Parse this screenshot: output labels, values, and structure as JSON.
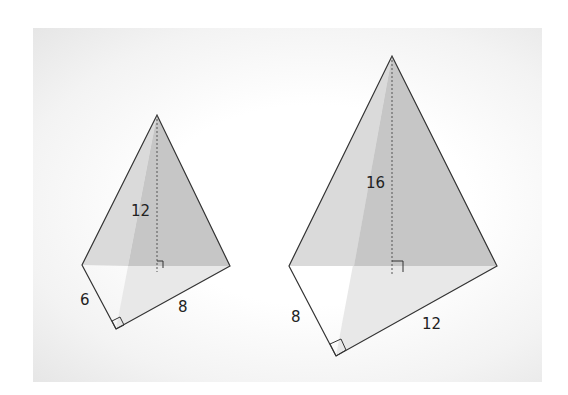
{
  "figures": [
    {
      "id": "small-pyramid",
      "labels": {
        "height": "12",
        "leg_a": "6",
        "leg_b": "8"
      },
      "points": {
        "apex": [
          157,
          115
        ],
        "left": [
          82,
          265
        ],
        "right": [
          230,
          266
        ],
        "bottom": [
          116,
          329
        ],
        "foot": [
          157,
          266
        ]
      }
    },
    {
      "id": "large-pyramid",
      "labels": {
        "height": "16",
        "leg_a": "8",
        "leg_b": "12"
      },
      "points": {
        "apex": [
          392,
          56
        ],
        "left": [
          289,
          266
        ],
        "right": [
          497,
          266
        ],
        "bottom": [
          336,
          356
        ],
        "foot": [
          392,
          266
        ]
      }
    }
  ],
  "colors": {
    "front_face_light": "#dcdcdc",
    "front_face_dark": "#c4c4c4",
    "base_shade": "#e9e9e9",
    "edge": "#333333"
  }
}
